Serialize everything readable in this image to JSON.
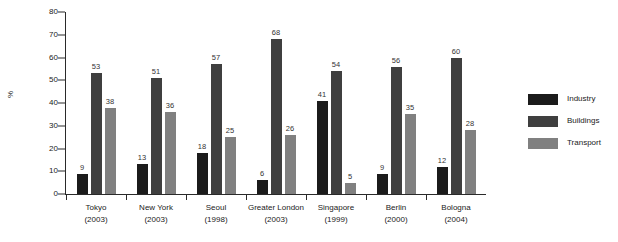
{
  "chart_data": {
    "type": "bar",
    "title": "",
    "subtitle": "",
    "xlabel": "",
    "ylabel": "%",
    "ylim": [
      0,
      80
    ],
    "ytick_step": 10,
    "yticks": [
      "80",
      "70",
      "60",
      "50",
      "40",
      "30",
      "20",
      "10",
      "0"
    ],
    "grid": false,
    "legend_position": "right",
    "categories": [
      "Tokyo",
      "New York",
      "Seoul",
      "Greater London",
      "Singapore",
      "Berlin",
      "Bologna"
    ],
    "category_years": [
      "(2003)",
      "(2003)",
      "(1998)",
      "(2003)",
      "(1999)",
      "(2000)",
      "(2004)"
    ],
    "series": [
      {
        "name": "Industry",
        "color": "#1b1b1b",
        "values": [
          9,
          13,
          18,
          6,
          41,
          9,
          12
        ]
      },
      {
        "name": "Buildings",
        "color": "#3f3f3f",
        "values": [
          53,
          51,
          57,
          68,
          54,
          56,
          60
        ]
      },
      {
        "name": "Transport",
        "color": "#808080",
        "values": [
          38,
          36,
          25,
          26,
          5,
          35,
          28
        ]
      }
    ]
  },
  "legend": {
    "items": [
      {
        "label": "Industry",
        "color": "#1b1b1b"
      },
      {
        "label": "Buildings",
        "color": "#3f3f3f"
      },
      {
        "label": "Transport",
        "color": "#808080"
      }
    ]
  },
  "axis": {
    "y_title": "%"
  }
}
